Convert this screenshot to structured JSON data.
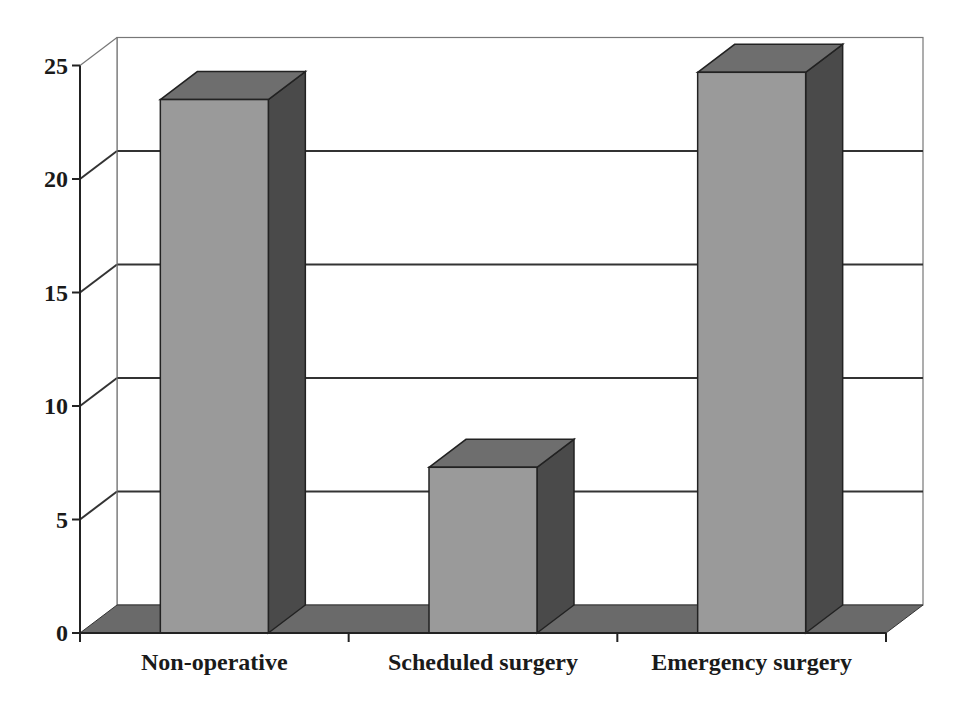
{
  "chart_data": {
    "type": "bar",
    "style": "3d-column",
    "title": "",
    "xlabel": "",
    "ylabel": "",
    "categories": [
      "Non-operative",
      "Scheduled surgery",
      "Emergency surgery"
    ],
    "values": [
      23.5,
      7.3,
      24.7
    ],
    "ylim": [
      0,
      25
    ],
    "yticks": [
      0,
      5,
      10,
      15,
      20,
      25
    ],
    "grid": true,
    "legend": "none",
    "colors": {
      "bar_front": "#9a9a9a",
      "bar_top": "#6e6e6e",
      "bar_side": "#4a4a4a",
      "floor": "#6a6a6a",
      "grid": "#333333",
      "axis": "#222222",
      "wall": "#ffffff"
    }
  }
}
